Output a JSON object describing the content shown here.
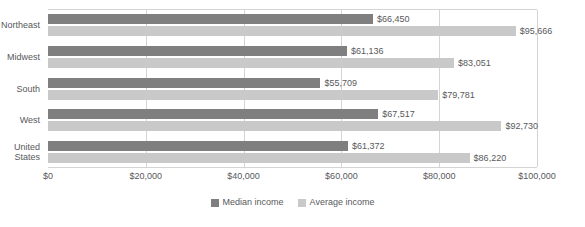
{
  "chart_data": {
    "type": "bar",
    "orientation": "horizontal",
    "title": "",
    "xlabel": "",
    "ylabel": "",
    "categories": [
      "Northeast",
      "Midwest",
      "South",
      "West",
      "United\nStates"
    ],
    "series": [
      {
        "name": "Median income",
        "color": "#7f7f7f",
        "values": [
          66450,
          61136,
          55709,
          67517,
          61372
        ],
        "labels": [
          "$66,450",
          "$61,136",
          "$55,709",
          "$67,517",
          "$61,372"
        ]
      },
      {
        "name": "Average income",
        "color": "#c9c9c9",
        "values": [
          95666,
          83051,
          79781,
          92730,
          86220
        ],
        "labels": [
          "$95,666",
          "$83,051",
          "$79,781",
          "$92,730",
          "$86,220"
        ]
      }
    ],
    "xlim": [
      0,
      100000
    ],
    "xticks": [
      0,
      20000,
      40000,
      60000,
      80000,
      100000
    ],
    "xticklabels": [
      "$0",
      "$20,000",
      "$40,000",
      "$60,000",
      "$80,000",
      "$100,000"
    ],
    "grid": "vertical",
    "legend_position": "bottom-center",
    "legend": [
      {
        "label": "Median income",
        "color": "#7f7f7f"
      },
      {
        "label": "Average income",
        "color": "#c9c9c9"
      }
    ],
    "axis_color": "#d4d4d4",
    "text_color": "#58595b"
  }
}
